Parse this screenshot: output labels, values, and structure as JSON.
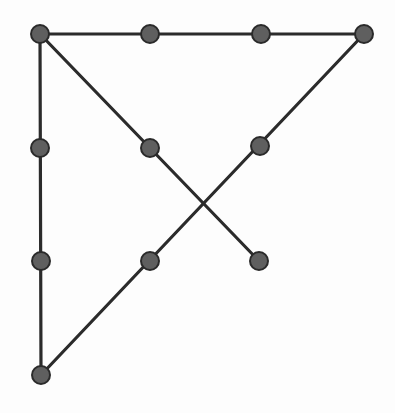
{
  "diagram": {
    "width": 395,
    "height": 413,
    "background": "#fdfdfd",
    "line_color": "#2b2b2b",
    "line_width": 3.2,
    "dot_fill": "#5f5f5f",
    "dot_stroke": "#2a2a2a",
    "dot_radius": 9,
    "dots": [
      {
        "id": "d1",
        "x": 40,
        "y": 34
      },
      {
        "id": "d2",
        "x": 150,
        "y": 34
      },
      {
        "id": "d3",
        "x": 261,
        "y": 34
      },
      {
        "id": "d4",
        "x": 364,
        "y": 34
      },
      {
        "id": "d5",
        "x": 40,
        "y": 148
      },
      {
        "id": "d6",
        "x": 150,
        "y": 148
      },
      {
        "id": "d7",
        "x": 260,
        "y": 146
      },
      {
        "id": "d8",
        "x": 41,
        "y": 261
      },
      {
        "id": "d9",
        "x": 150,
        "y": 261
      },
      {
        "id": "d10",
        "x": 259,
        "y": 261
      },
      {
        "id": "d11",
        "x": 41,
        "y": 375
      }
    ],
    "lines": [
      {
        "id": "top-edge",
        "x1": 40,
        "y1": 34,
        "x2": 364,
        "y2": 34
      },
      {
        "id": "left-edge",
        "x1": 40,
        "y1": 34,
        "x2": 41,
        "y2": 375
      },
      {
        "id": "diagonal-down",
        "x1": 40,
        "y1": 34,
        "x2": 259,
        "y2": 261
      },
      {
        "id": "diagonal-up",
        "x1": 364,
        "y1": 34,
        "x2": 41,
        "y2": 375
      }
    ]
  }
}
